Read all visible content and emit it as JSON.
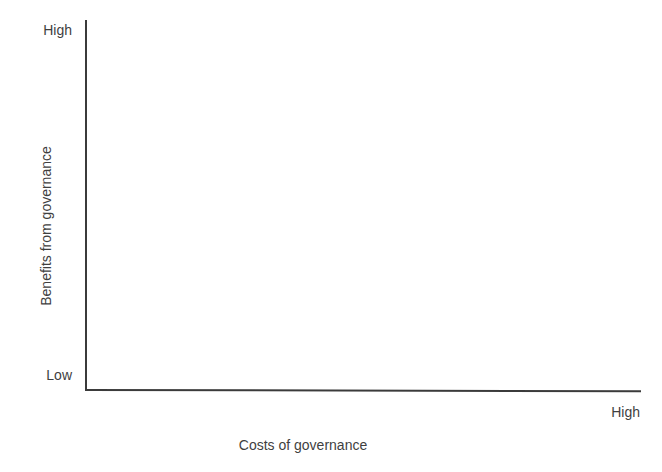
{
  "chart_data": {
    "type": "scatter",
    "title": "",
    "subtitle": "",
    "xlabel": "Costs of governance",
    "ylabel": "Benefits from governance",
    "x_tick_labels": [
      "High"
    ],
    "y_tick_labels": [
      "High",
      "Low"
    ],
    "x_axis_endpoint_label": "High",
    "y_axis_top_label": "High",
    "y_axis_bottom_label": "Low",
    "series": [],
    "values": [],
    "categories": [],
    "annotations": [],
    "legend": [],
    "legend_position": "none",
    "grid": false,
    "xlim": [
      "Low",
      "High"
    ],
    "ylim": [
      "Low",
      "High"
    ]
  },
  "figure": {
    "background_color": "#ffffff",
    "axis_color": "#3b3b3b",
    "text_color": "#3f3f3f"
  },
  "axes": {
    "y": {
      "title": "Benefits from governance",
      "high_label": "High",
      "low_label": "Low"
    },
    "x": {
      "title": "Costs of governance",
      "high_label": "High"
    }
  }
}
